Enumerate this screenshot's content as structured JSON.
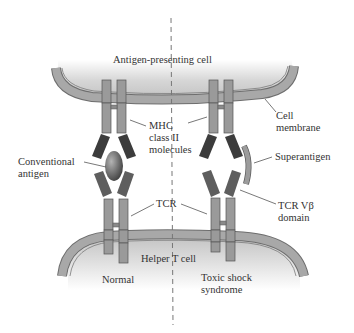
{
  "diagram": {
    "type": "biology-illustration",
    "labels": {
      "apc": "Antigen-presenting cell",
      "cell_membrane_1": "Cell",
      "cell_membrane_2": "membrane",
      "mhc_1": "MHC",
      "mhc_2": "class II",
      "mhc_3": "molecules",
      "conventional_1": "Conventional",
      "conventional_2": "antigen",
      "superantigen": "Superantigen",
      "tcr": "TCR",
      "tcr_vb_1": "TCR Vβ",
      "tcr_vb_2": "domain",
      "helper": "Helper T cell",
      "normal": "Normal",
      "toxic_1": "Toxic shock",
      "toxic_2": "syndrome"
    },
    "panels": [
      "Normal",
      "Toxic shock syndrome"
    ],
    "colors": {
      "membrane": "#a8a8a8",
      "membrane_edge": "#6e6e6e",
      "cell_fill_top": "#c8c8c8",
      "cell_fill_fade": "#ffffff",
      "stalk": "#9a9a9a",
      "stalk_edge": "#555555",
      "domain_dark": "#3c3c3c",
      "domain_mid": "#5e5e5e",
      "antigen": "#6a6a6a",
      "superantigen": "#9c9c9c",
      "divider": "#777777",
      "text": "#333333"
    }
  }
}
